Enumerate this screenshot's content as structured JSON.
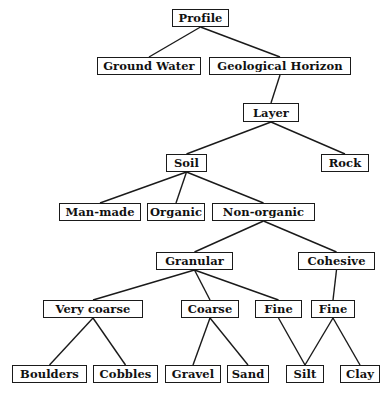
{
  "diagram": {
    "type": "tree",
    "line_color": "#1a1a1a",
    "nodes": [
      {
        "id": "profile",
        "label": "Profile",
        "x": 172,
        "y": 9,
        "w": 57,
        "h": 18
      },
      {
        "id": "ground_water",
        "label": "Ground Water",
        "x": 97,
        "y": 57,
        "w": 104,
        "h": 18
      },
      {
        "id": "geological_horizon",
        "label": "Geological Horizon",
        "x": 209,
        "y": 57,
        "w": 142,
        "h": 18
      },
      {
        "id": "layer",
        "label": "Layer",
        "x": 243,
        "y": 103,
        "w": 56,
        "h": 19
      },
      {
        "id": "soil",
        "label": "Soil",
        "x": 166,
        "y": 154,
        "w": 41,
        "h": 18
      },
      {
        "id": "rock",
        "label": "Rock",
        "x": 321,
        "y": 154,
        "w": 48,
        "h": 18
      },
      {
        "id": "man_made",
        "label": "Man-made",
        "x": 59,
        "y": 203,
        "w": 82,
        "h": 18
      },
      {
        "id": "organic",
        "label": "Organic",
        "x": 147,
        "y": 203,
        "w": 58,
        "h": 18
      },
      {
        "id": "non_organic",
        "label": "Non-organic",
        "x": 212,
        "y": 203,
        "w": 103,
        "h": 18
      },
      {
        "id": "granular",
        "label": "Granular",
        "x": 156,
        "y": 252,
        "w": 77,
        "h": 18
      },
      {
        "id": "cohesive",
        "label": "Cohesive",
        "x": 298,
        "y": 252,
        "w": 77,
        "h": 18
      },
      {
        "id": "very_coarse",
        "label": "Very coarse",
        "x": 43,
        "y": 300,
        "w": 100,
        "h": 18
      },
      {
        "id": "coarse",
        "label": "Coarse",
        "x": 181,
        "y": 300,
        "w": 58,
        "h": 18
      },
      {
        "id": "fine_granular",
        "label": "Fine",
        "x": 255,
        "y": 300,
        "w": 47,
        "h": 18
      },
      {
        "id": "fine_cohesive",
        "label": "Fine",
        "x": 311,
        "y": 300,
        "w": 44,
        "h": 18
      },
      {
        "id": "boulders",
        "label": "Boulders",
        "x": 12,
        "y": 365,
        "w": 75,
        "h": 18
      },
      {
        "id": "cobbles",
        "label": "Cobbles",
        "x": 93,
        "y": 365,
        "w": 65,
        "h": 18
      },
      {
        "id": "gravel",
        "label": "Gravel",
        "x": 165,
        "y": 365,
        "w": 56,
        "h": 18
      },
      {
        "id": "sand",
        "label": "Sand",
        "x": 227,
        "y": 365,
        "w": 42,
        "h": 18
      },
      {
        "id": "silt",
        "label": "Silt",
        "x": 286,
        "y": 365,
        "w": 38,
        "h": 18
      },
      {
        "id": "clay",
        "label": "Clay",
        "x": 340,
        "y": 365,
        "w": 40,
        "h": 18
      }
    ],
    "edges": [
      {
        "from": "profile",
        "to": "ground_water"
      },
      {
        "from": "profile",
        "to": "geological_horizon"
      },
      {
        "from": "geological_horizon",
        "to": "layer"
      },
      {
        "from": "layer",
        "to": "soil"
      },
      {
        "from": "layer",
        "to": "rock"
      },
      {
        "from": "soil",
        "to": "man_made"
      },
      {
        "from": "soil",
        "to": "organic"
      },
      {
        "from": "soil",
        "to": "non_organic"
      },
      {
        "from": "non_organic",
        "to": "granular"
      },
      {
        "from": "non_organic",
        "to": "cohesive"
      },
      {
        "from": "granular",
        "to": "very_coarse"
      },
      {
        "from": "granular",
        "to": "coarse"
      },
      {
        "from": "granular",
        "to": "fine_granular"
      },
      {
        "from": "cohesive",
        "to": "fine_cohesive"
      },
      {
        "from": "very_coarse",
        "to": "boulders"
      },
      {
        "from": "very_coarse",
        "to": "cobbles"
      },
      {
        "from": "coarse",
        "to": "gravel"
      },
      {
        "from": "coarse",
        "to": "sand"
      },
      {
        "from": "fine_granular",
        "to": "silt"
      },
      {
        "from": "fine_cohesive",
        "to": "silt"
      },
      {
        "from": "fine_cohesive",
        "to": "clay"
      }
    ]
  },
  "labels": {
    "profile": "Profile",
    "ground_water": "Ground Water",
    "geological_horizon": "Geological Horizon",
    "layer": "Layer",
    "soil": "Soil",
    "rock": "Rock",
    "man_made": "Man-made",
    "organic": "Organic",
    "non_organic": "Non-organic",
    "granular": "Granular",
    "cohesive": "Cohesive",
    "very_coarse": "Very coarse",
    "coarse": "Coarse",
    "fine_granular": "Fine",
    "fine_cohesive": "Fine",
    "boulders": "Boulders",
    "cobbles": "Cobbles",
    "gravel": "Gravel",
    "sand": "Sand",
    "silt": "Silt",
    "clay": "Clay"
  }
}
